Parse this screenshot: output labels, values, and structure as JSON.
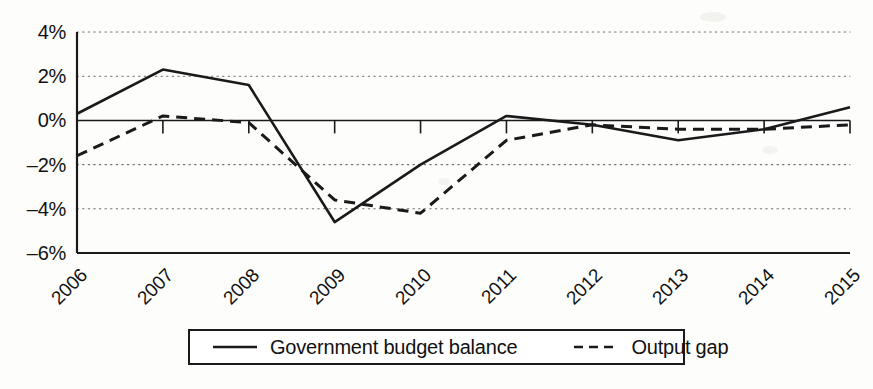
{
  "chart_data": {
    "type": "line",
    "title": "",
    "xlabel": "",
    "ylabel": "",
    "categories": [
      "2006",
      "2007",
      "2008",
      "2009",
      "2010",
      "2011",
      "2012",
      "2013",
      "2014",
      "2015"
    ],
    "ylim": [
      -6,
      4
    ],
    "yticks": [
      4,
      2,
      0,
      -2,
      -4,
      -6
    ],
    "ytick_labels": [
      "4%",
      "2%",
      "0%",
      "-2%",
      "-4%",
      "-6%"
    ],
    "grid": true,
    "grid_style": "dotted-horizontal",
    "legend_position": "bottom-center",
    "series": [
      {
        "name": "Government budget balance",
        "style": "solid",
        "color": "#1a1a1a",
        "values": [
          0.3,
          2.3,
          1.6,
          -4.6,
          -2.0,
          0.2,
          -0.2,
          -0.9,
          -0.4,
          0.6
        ]
      },
      {
        "name": "Output gap",
        "style": "dashed",
        "color": "#1a1a1a",
        "values": [
          -1.6,
          0.2,
          -0.1,
          -3.6,
          -4.2,
          -0.9,
          -0.2,
          -0.4,
          -0.4,
          -0.2
        ]
      }
    ]
  },
  "legend": {
    "items": [
      {
        "label": "Government budget balance",
        "style": "solid"
      },
      {
        "label": "Output gap",
        "style": "dashed"
      }
    ]
  },
  "axes": {
    "y_axis_name": "percent-axis",
    "x_axis_name": "year-axis"
  }
}
